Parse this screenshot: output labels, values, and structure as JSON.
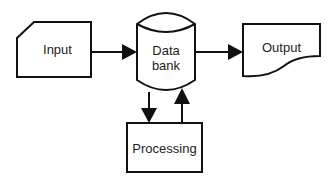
{
  "diagram": {
    "type": "flowchart",
    "nodes": [
      {
        "id": "input",
        "label": "Input",
        "shape": "manual-input"
      },
      {
        "id": "databank",
        "label_line1": "Data",
        "label_line2": "bank",
        "shape": "cylinder"
      },
      {
        "id": "output",
        "label": "Output",
        "shape": "document"
      },
      {
        "id": "processing",
        "label": "Processing",
        "shape": "rectangle"
      }
    ],
    "edges": [
      {
        "from": "input",
        "to": "databank"
      },
      {
        "from": "databank",
        "to": "output"
      },
      {
        "from": "databank",
        "to": "processing"
      },
      {
        "from": "processing",
        "to": "databank"
      }
    ],
    "colors": {
      "stroke": "#111111",
      "background": "#ffffff",
      "text": "#222222"
    }
  }
}
